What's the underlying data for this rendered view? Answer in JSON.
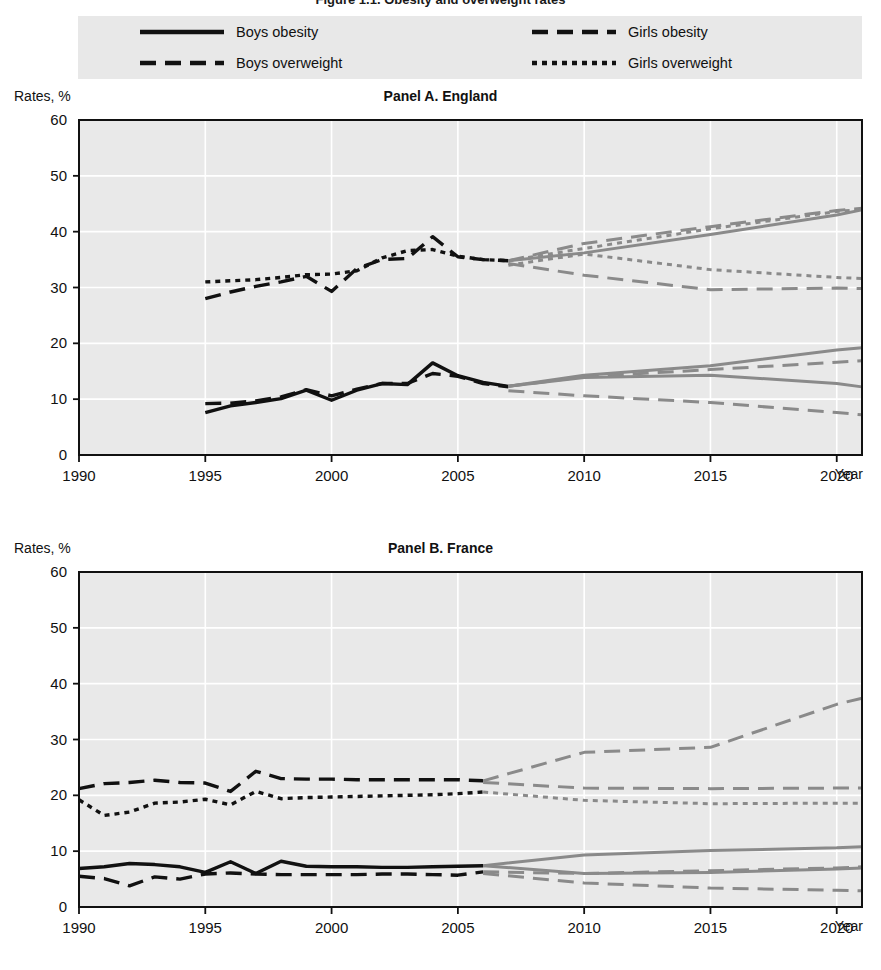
{
  "figure": {
    "cropped_title": "Figure 1.1. Obesity and overweight rates",
    "legend": [
      {
        "key": "boys_obesity",
        "label": "Boys obesity",
        "style": "solid",
        "swatch": "solid-line-swatch"
      },
      {
        "key": "girls_obesity",
        "label": "Girls obesity",
        "style": "long-dash",
        "swatch": "long-dash-line-swatch"
      },
      {
        "key": "boys_overweight",
        "label": "Boys overweight",
        "style": "long-dash",
        "swatch": "long-dash-line-swatch"
      },
      {
        "key": "girls_overweight",
        "label": "Girls overweight",
        "style": "short-dash",
        "swatch": "short-dash-line-swatch"
      }
    ],
    "colors": {
      "observed": "#111111",
      "projected": "#8a8a8a",
      "plot_background": "#e9e9e9",
      "legend_background": "#e8e8e8",
      "grid": "#ffffff"
    },
    "axis_unit_label": "Rates, %",
    "x_axis_label": "Year"
  },
  "chart_data": [
    {
      "type": "line",
      "title": "Panel A. England",
      "xlabel": "Year",
      "ylabel": "Rates, %",
      "xlim": [
        1990,
        2021
      ],
      "ylim": [
        0,
        60
      ],
      "yticks": [
        0,
        10,
        20,
        30,
        40,
        50,
        60
      ],
      "xticks": [
        1990,
        1995,
        2000,
        2005,
        2010,
        2015,
        2020
      ],
      "grid": true,
      "legend_position": "top",
      "series": [
        {
          "name": "Boys overweight (observed)",
          "style": "long-dash",
          "color": "#111111",
          "segment": "observed",
          "x": [
            1995,
            1996,
            1997,
            1998,
            1999,
            2000,
            2001,
            2002,
            2003,
            2004,
            2005,
            2006,
            2007
          ],
          "y": [
            28.0,
            29.2,
            30.2,
            31.0,
            32.0,
            29.3,
            33.4,
            35.0,
            35.2,
            39.1,
            35.5,
            35.0,
            34.8
          ]
        },
        {
          "name": "Girls overweight (observed)",
          "style": "short-dash",
          "color": "#111111",
          "segment": "observed",
          "x": [
            1995,
            1996,
            1997,
            1998,
            1999,
            2000,
            2001,
            2002,
            2003,
            2004,
            2005,
            2006,
            2007
          ],
          "y": [
            31.0,
            31.2,
            31.4,
            31.8,
            32.3,
            32.4,
            33.0,
            35.3,
            36.6,
            36.8,
            35.6,
            35.0,
            34.8
          ]
        },
        {
          "name": "Boys obesity (observed)",
          "style": "solid",
          "color": "#111111",
          "segment": "observed",
          "x": [
            1995,
            1996,
            1997,
            1998,
            1999,
            2000,
            2001,
            2002,
            2003,
            2004,
            2005,
            2006,
            2007
          ],
          "y": [
            7.6,
            8.8,
            9.4,
            10.1,
            11.6,
            9.8,
            11.6,
            12.8,
            12.6,
            16.5,
            14.2,
            13.0,
            12.3
          ]
        },
        {
          "name": "Girls obesity (observed)",
          "style": "long-dash",
          "color": "#111111",
          "segment": "observed",
          "x": [
            1995,
            1996,
            1997,
            1998,
            1999,
            2000,
            2001,
            2002,
            2003,
            2004,
            2005,
            2006,
            2007
          ],
          "y": [
            9.2,
            9.3,
            9.7,
            10.4,
            11.7,
            10.6,
            11.8,
            12.8,
            12.8,
            14.6,
            14.1,
            12.8,
            12.2
          ]
        },
        {
          "name": "Boys overweight (projected high)",
          "style": "long-dash",
          "color": "#8a8a8a",
          "segment": "projected",
          "x": [
            2007,
            2010,
            2015,
            2020,
            2021
          ],
          "y": [
            34.8,
            37.9,
            40.9,
            43.8,
            44.2
          ]
        },
        {
          "name": "Girls overweight (projected)",
          "style": "short-dash",
          "color": "#8a8a8a",
          "segment": "projected",
          "x": [
            2007,
            2010,
            2015,
            2020,
            2021
          ],
          "y": [
            34.8,
            37.0,
            40.5,
            43.6,
            44.0
          ]
        },
        {
          "name": "Boys overweight (projected low)",
          "style": "solid",
          "color": "#8a8a8a",
          "segment": "projected",
          "x": [
            2007,
            2010,
            2015,
            2020,
            2021
          ],
          "y": [
            34.8,
            36.2,
            39.5,
            43.0,
            43.9
          ]
        },
        {
          "name": "Girls overweight (projected flat)",
          "style": "short-dash",
          "color": "#8a8a8a",
          "segment": "projected",
          "x": [
            2007,
            2010,
            2015,
            2020,
            2021
          ],
          "y": [
            34.0,
            36.0,
            33.2,
            31.8,
            31.6
          ]
        },
        {
          "name": "Girls overweight (projected declining)",
          "style": "long-dash",
          "color": "#8a8a8a",
          "segment": "projected",
          "x": [
            2007,
            2010,
            2015,
            2020,
            2021
          ],
          "y": [
            34.3,
            32.2,
            29.6,
            29.9,
            29.8
          ]
        },
        {
          "name": "Boys obesity (projected high)",
          "style": "solid",
          "color": "#8a8a8a",
          "segment": "projected",
          "x": [
            2007,
            2010,
            2015,
            2020,
            2021
          ],
          "y": [
            12.3,
            14.3,
            16.0,
            18.8,
            19.2
          ]
        },
        {
          "name": "Girls obesity (projected high)",
          "style": "long-dash",
          "color": "#8a8a8a",
          "segment": "projected",
          "x": [
            2007,
            2010,
            2015,
            2020,
            2021
          ],
          "y": [
            12.3,
            14.0,
            15.3,
            16.6,
            16.9
          ]
        },
        {
          "name": "Boys obesity (projected low)",
          "style": "solid",
          "color": "#8a8a8a",
          "segment": "projected",
          "x": [
            2007,
            2010,
            2015,
            2020,
            2021
          ],
          "y": [
            12.3,
            13.9,
            14.3,
            12.8,
            12.2
          ]
        },
        {
          "name": "Girls obesity (projected low)",
          "style": "long-dash",
          "color": "#8a8a8a",
          "segment": "projected",
          "x": [
            2007,
            2010,
            2015,
            2020,
            2021
          ],
          "y": [
            11.5,
            10.6,
            9.4,
            7.6,
            7.2
          ]
        }
      ]
    },
    {
      "type": "line",
      "title": "Panel B. France",
      "xlabel": "Year",
      "ylabel": "Rates, %",
      "xlim": [
        1990,
        2021
      ],
      "ylim": [
        0,
        60
      ],
      "yticks": [
        0,
        10,
        20,
        30,
        40,
        50,
        60
      ],
      "xticks": [
        1990,
        1995,
        2000,
        2005,
        2010,
        2015,
        2020
      ],
      "grid": true,
      "legend_position": "top",
      "series": [
        {
          "name": "Boys overweight (observed)",
          "style": "long-dash",
          "color": "#111111",
          "segment": "observed",
          "x": [
            1990,
            1991,
            1992,
            1993,
            1994,
            1995,
            1996,
            1997,
            1998,
            1999,
            2000,
            2001,
            2002,
            2003,
            2004,
            2005,
            2006
          ],
          "y": [
            21.2,
            22.1,
            22.3,
            22.7,
            22.3,
            22.2,
            20.7,
            24.3,
            23.0,
            22.9,
            22.9,
            22.8,
            22.8,
            22.8,
            22.8,
            22.8,
            22.6
          ]
        },
        {
          "name": "Girls overweight (observed)",
          "style": "short-dash",
          "color": "#111111",
          "segment": "observed",
          "x": [
            1990,
            1991,
            1992,
            1993,
            1994,
            1995,
            1996,
            1997,
            1998,
            1999,
            2000,
            2001,
            2002,
            2003,
            2004,
            2005,
            2006
          ],
          "y": [
            19.2,
            16.4,
            17.0,
            18.6,
            18.8,
            19.3,
            18.3,
            20.7,
            19.4,
            19.6,
            19.7,
            19.8,
            19.9,
            20.0,
            20.1,
            20.3,
            20.6
          ]
        },
        {
          "name": "Boys obesity (observed)",
          "style": "solid",
          "color": "#111111",
          "segment": "observed",
          "x": [
            1990,
            1991,
            1992,
            1993,
            1994,
            1995,
            1996,
            1997,
            1998,
            1999,
            2000,
            2001,
            2002,
            2003,
            2004,
            2005,
            2006
          ],
          "y": [
            6.9,
            7.2,
            7.8,
            7.6,
            7.2,
            6.2,
            8.1,
            6.0,
            8.2,
            7.3,
            7.2,
            7.2,
            7.1,
            7.1,
            7.2,
            7.3,
            7.4
          ]
        },
        {
          "name": "Girls obesity (observed)",
          "style": "long-dash",
          "color": "#111111",
          "segment": "observed",
          "x": [
            1990,
            1991,
            1992,
            1993,
            1994,
            1995,
            1996,
            1997,
            1998,
            1999,
            2000,
            2001,
            2002,
            2003,
            2004,
            2005,
            2006
          ],
          "y": [
            5.5,
            5.1,
            3.8,
            5.4,
            5.0,
            5.9,
            6.1,
            5.9,
            5.8,
            5.8,
            5.8,
            5.8,
            5.9,
            5.9,
            5.8,
            5.7,
            6.3
          ]
        },
        {
          "name": "Boys overweight (projected rising)",
          "style": "long-dash",
          "color": "#8a8a8a",
          "segment": "projected",
          "x": [
            2006,
            2010,
            2015,
            2020,
            2021
          ],
          "y": [
            22.6,
            27.7,
            28.6,
            36.3,
            37.4
          ]
        },
        {
          "name": "Boys overweight (projected flat)",
          "style": "long-dash",
          "color": "#8a8a8a",
          "segment": "projected",
          "x": [
            2006,
            2010,
            2015,
            2020,
            2021
          ],
          "y": [
            22.3,
            21.3,
            21.2,
            21.3,
            21.3
          ]
        },
        {
          "name": "Girls overweight (projected)",
          "style": "short-dash",
          "color": "#8a8a8a",
          "segment": "projected",
          "x": [
            2006,
            2010,
            2015,
            2020,
            2021
          ],
          "y": [
            20.6,
            19.1,
            18.5,
            18.6,
            18.6
          ]
        },
        {
          "name": "Boys obesity (projected high)",
          "style": "solid",
          "color": "#8a8a8a",
          "segment": "projected",
          "x": [
            2006,
            2010,
            2015,
            2020,
            2021
          ],
          "y": [
            7.4,
            9.3,
            10.1,
            10.6,
            10.8
          ]
        },
        {
          "name": "Boys obesity (projected low)",
          "style": "solid",
          "color": "#8a8a8a",
          "segment": "projected",
          "x": [
            2006,
            2010,
            2015,
            2020,
            2021
          ],
          "y": [
            7.4,
            6.0,
            6.2,
            6.8,
            7.0
          ]
        },
        {
          "name": "Girls obesity (projected high)",
          "style": "long-dash",
          "color": "#8a8a8a",
          "segment": "projected",
          "x": [
            2006,
            2010,
            2015,
            2020,
            2021
          ],
          "y": [
            6.3,
            6.0,
            6.5,
            7.0,
            7.2
          ]
        },
        {
          "name": "Girls obesity (projected low)",
          "style": "long-dash",
          "color": "#8a8a8a",
          "segment": "projected",
          "x": [
            2006,
            2010,
            2015,
            2020,
            2021
          ],
          "y": [
            6.0,
            4.3,
            3.4,
            3.0,
            2.9
          ]
        }
      ]
    }
  ]
}
